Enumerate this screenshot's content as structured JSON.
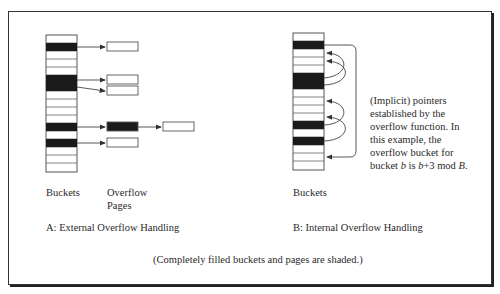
{
  "diagram": {
    "part_a": {
      "title": "A: External Overflow Handling",
      "buckets_label": "Buckets",
      "overflow_label_line1": "Overflow",
      "overflow_label_line2": "Pages",
      "bucket_rows": 17,
      "shaded_rows": [
        1,
        5,
        6,
        11,
        13
      ],
      "overflow_chains": [
        {
          "from_row": 1,
          "pages": [
            "empty"
          ]
        },
        {
          "from_row": 5,
          "pages": [
            "empty"
          ]
        },
        {
          "from_row": 6,
          "pages": [
            "empty"
          ]
        },
        {
          "from_row": 11,
          "pages": [
            "full",
            "empty"
          ]
        },
        {
          "from_row": 13,
          "pages": [
            "empty"
          ]
        }
      ]
    },
    "part_b": {
      "title": "B: Internal Overflow Handling",
      "buckets_label": "Buckets",
      "bucket_rows": 17,
      "shaded_rows": [
        1,
        5,
        6,
        11,
        13
      ],
      "pointers": [
        {
          "from_row": 1,
          "to_row": 15,
          "style": "outer"
        },
        {
          "from_row": 5,
          "to_row": 8
        },
        {
          "from_row": 6,
          "to_row": 9
        },
        {
          "from_row": 11,
          "to_row": 14
        },
        {
          "from_row": 13,
          "to_row": 16
        }
      ],
      "note_lines": [
        "(Implicit) pointers",
        "established by the",
        "overflow function. In",
        "this example, the",
        "overflow bucket for"
      ],
      "note_last": {
        "w1": "bucket ",
        "b1": "b",
        "w2": " is ",
        "b2": "b",
        "w3": "+3 mod ",
        "B": "B",
        "w4": "."
      }
    },
    "caption": "(Completely filled buckets and pages are shaded.)",
    "colors": {
      "shade": "#1a1a1a",
      "line": "#444444",
      "frame": "#333333"
    }
  }
}
